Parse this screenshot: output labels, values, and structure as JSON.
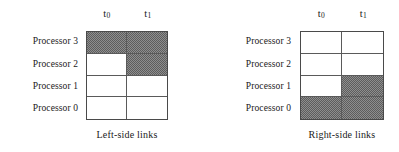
{
  "figure": {
    "background_color": "#ffffff",
    "text_color": "#1a1a1a",
    "shade_color": "#7a7a7a",
    "border_color": "#4a4a4a"
  },
  "panels": [
    {
      "id": "left-side-links",
      "caption": "Left-side links",
      "column_headers": [
        {
          "base": "t",
          "subscript": "0"
        },
        {
          "base": "t",
          "subscript": "1"
        }
      ],
      "row_labels": [
        "Processor 3",
        "Processor 2",
        "Processor 1",
        "Processor 0"
      ],
      "cells": [
        [
          "shaded",
          "shaded"
        ],
        [
          "empty",
          "shaded"
        ],
        [
          "empty",
          "empty"
        ],
        [
          "empty",
          "empty"
        ]
      ]
    },
    {
      "id": "right-side-links",
      "caption": "Right-side links",
      "column_headers": [
        {
          "base": "t",
          "subscript": "0"
        },
        {
          "base": "t",
          "subscript": "1"
        }
      ],
      "row_labels": [
        "Processor 3",
        "Processor 2",
        "Processor 1",
        "Processor 0"
      ],
      "cells": [
        [
          "empty",
          "empty"
        ],
        [
          "empty",
          "empty"
        ],
        [
          "empty",
          "shaded"
        ],
        [
          "shaded",
          "shaded"
        ]
      ]
    }
  ]
}
